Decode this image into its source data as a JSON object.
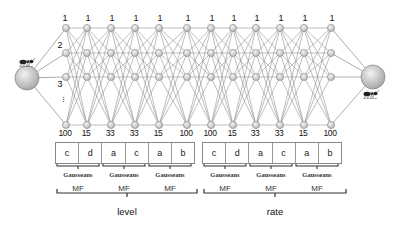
{
  "diagram": {
    "type": "neural-network-architecture",
    "input_node": {
      "icon": "ant-icon",
      "x": 27,
      "y": 78
    },
    "output_node": {
      "icon": "ant-icon",
      "x": 373,
      "y": 77
    },
    "columns_x": [
      66,
      87,
      111,
      135,
      159,
      187,
      211,
      233,
      256,
      280,
      304,
      331
    ],
    "rows_y": [
      28,
      53,
      77,
      125
    ],
    "row_labels": [
      "1",
      "2",
      "3",
      "⋮"
    ],
    "top_labels": [
      "1",
      "1",
      "1",
      "1",
      "1",
      "1",
      "1",
      "1",
      "1",
      "1",
      "1",
      "1"
    ],
    "bottom_labels": [
      "100",
      "15",
      "33",
      "33",
      "15",
      "100",
      "100",
      "15",
      "33",
      "33",
      "15",
      "100"
    ],
    "groups": [
      {
        "name": "level",
        "cells": [
          "c",
          "d",
          "a",
          "c",
          "a",
          "b"
        ],
        "mf_pairs": [
          {
            "gauss": "Gausseans",
            "mf": "MF"
          },
          {
            "gauss": "Gausseans",
            "mf": "MF"
          },
          {
            "gauss": "Gausseans",
            "mf": "MF"
          }
        ]
      },
      {
        "name": "rate",
        "cells": [
          "c",
          "d",
          "a",
          "c",
          "a",
          "b"
        ],
        "mf_pairs": [
          {
            "gauss": "Gausseans",
            "mf": "MF"
          },
          {
            "gauss": "Gausseans",
            "mf": "MF"
          },
          {
            "gauss": "Gausseans",
            "mf": "MF"
          }
        ]
      }
    ],
    "colors": {
      "node_fill": "#d0d0d0",
      "node_stroke": "#888888",
      "edge": "#8a8a8a",
      "big_node_fill": "#c8c8c8"
    }
  }
}
